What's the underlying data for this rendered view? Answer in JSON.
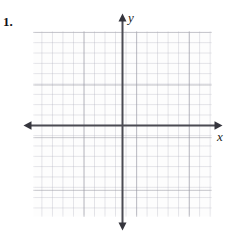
{
  "page": {
    "width": 238,
    "height": 238,
    "background_color": "#ffffff",
    "kind": "worksheet-coordinate-grid"
  },
  "problem": {
    "number_label": "1."
  },
  "graph": {
    "name": "blank-cartesian-coordinate-plane",
    "grid": {
      "visible": true,
      "left": 33,
      "top": 31,
      "width": 179,
      "height": 186,
      "minor_cell_px": 10.5,
      "major_every_n_cells": 5,
      "columns": 17,
      "rows": 18,
      "minor_line_color": "#afafbc",
      "major_line_color": "#9696a0",
      "paper_color": "#fdfdfd"
    },
    "axes": {
      "color": "#4a4a52",
      "stroke_width": 2,
      "origin_x": 122.5,
      "origin_y": 125.5,
      "x_axis": {
        "label": "x",
        "label_style": "italic-serif",
        "from_x": 24,
        "to_x": 222,
        "arrowheads": "both"
      },
      "y_axis": {
        "label": "y",
        "label_style": "italic-serif",
        "from_y": 14,
        "to_y": 230,
        "arrowheads": "both"
      }
    },
    "tick_labels": [],
    "plotted_data": [],
    "notes": "Empty graph — no curves, points, or numeric tick labels are drawn."
  }
}
